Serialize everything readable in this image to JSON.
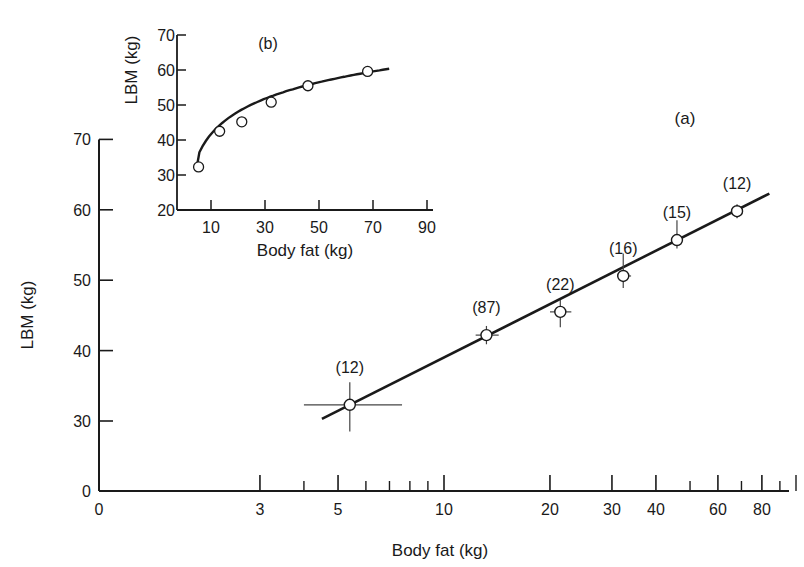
{
  "chart_data": [
    {
      "id": "a",
      "type": "scatter",
      "panel_label": "(a)",
      "title": "",
      "xlabel": "Body fat (kg)",
      "ylabel": "LBM (kg)",
      "xscale": "log",
      "x_ticks": [
        0,
        3,
        5,
        10,
        20,
        30,
        40,
        60,
        80
      ],
      "x_minor_ticks": [
        4,
        6,
        7,
        8,
        9,
        50,
        70,
        90,
        100
      ],
      "y_ticks": [
        0,
        30,
        40,
        50,
        60,
        70
      ],
      "y_axis_break": true,
      "grid": false,
      "series": [
        {
          "name": "Group means",
          "points": [
            {
              "x": 5.4,
              "y": 32.3,
              "n_label": "(12)",
              "xerr": [
                4.0,
                7.6
              ],
              "yerr": [
                28.5,
                35.5
              ]
            },
            {
              "x": 13.2,
              "y": 42.2,
              "n_label": "(87)",
              "xerr": [
                12.3,
                14.3
              ],
              "yerr": [
                40.9,
                43.5
              ]
            },
            {
              "x": 21.4,
              "y": 45.5,
              "n_label": "(22)",
              "xerr": [
                20.0,
                23.0
              ],
              "yerr": [
                43.3,
                47.2
              ]
            },
            {
              "x": 32.3,
              "y": 50.6,
              "n_label": "(16)",
              "xerr": [
                31.0,
                34.0
              ],
              "yerr": [
                48.9,
                53.8
              ]
            },
            {
              "x": 45.9,
              "y": 55.7,
              "n_label": "(15)",
              "xerr": [
                44.5,
                47.0
              ],
              "yerr": [
                54.5,
                58.5
              ]
            },
            {
              "x": 68.0,
              "y": 59.8,
              "n_label": "(12)",
              "xerr": [
                66.5,
                69.5
              ],
              "yerr": [
                58.8,
                60.8
              ]
            }
          ]
        },
        {
          "name": "Regression line",
          "line": [
            {
              "x": 4.5,
              "y": 30.3
            },
            {
              "x": 84,
              "y": 62.3
            }
          ]
        }
      ]
    },
    {
      "id": "b",
      "type": "scatter",
      "panel_label": "(b)",
      "title": "",
      "xlabel": "Body fat (kg)",
      "ylabel": "LBM (kg)",
      "xscale": "linear",
      "x_ticks": [
        10,
        30,
        50,
        70,
        90
      ],
      "y_ticks": [
        20,
        30,
        40,
        50,
        60,
        70
      ],
      "xlim": [
        0,
        93
      ],
      "ylim": [
        20,
        70
      ],
      "grid": false,
      "series": [
        {
          "name": "Group means",
          "points": [
            {
              "x": 5.4,
              "y": 32.3
            },
            {
              "x": 13.2,
              "y": 42.5
            },
            {
              "x": 21.4,
              "y": 45.2
            },
            {
              "x": 32.3,
              "y": 50.8
            },
            {
              "x": 45.9,
              "y": 55.5
            },
            {
              "x": 68.0,
              "y": 59.6
            }
          ]
        },
        {
          "name": "Fitted curve",
          "curve_x_range": [
            4.5,
            76
          ]
        }
      ]
    }
  ],
  "labels": {
    "panel_a": "(a)",
    "panel_b": "(b)",
    "main_xlabel": "Body fat (kg)",
    "main_ylabel": "LBM (kg)",
    "inset_xlabel": "Body fat (kg)",
    "inset_ylabel": "LBM (kg)"
  }
}
